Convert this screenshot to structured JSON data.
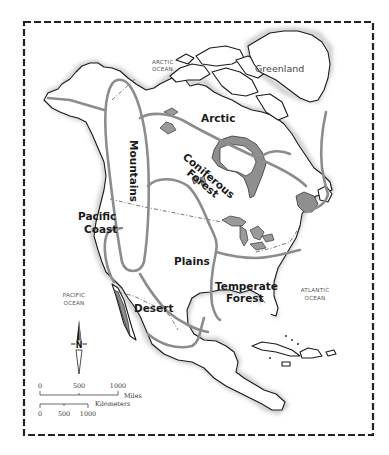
{
  "map": {
    "title": "North America Biomes",
    "regions": [
      {
        "id": "arctic",
        "label": "Arctic"
      },
      {
        "id": "mountains",
        "label": "Mountains"
      },
      {
        "id": "coniferous",
        "label_line1": "Coniferous",
        "label_line2": "Forest"
      },
      {
        "id": "pacific-coast",
        "label_line1": "Pacific",
        "label_line2": "Coast"
      },
      {
        "id": "plains",
        "label": "Plains"
      },
      {
        "id": "temperate",
        "label_line1": "Temperate",
        "label_line2": "Forest"
      },
      {
        "id": "desert",
        "label": "Desert"
      }
    ],
    "places": {
      "greenland": "Greenland"
    },
    "oceans": {
      "arctic_line1": "ARCTIC",
      "arctic_line2": "OCEAN",
      "pacific_line1": "PACIFIC",
      "pacific_line2": "OCEAN",
      "atlantic_line1": "ATLANTIC",
      "atlantic_line2": "OCEAN"
    },
    "compass": {
      "label": "N"
    },
    "scale": {
      "miles_ticks": [
        "0",
        "500",
        "1000"
      ],
      "miles_unit": "Miles",
      "km_ticks": [
        "0",
        "500",
        "1000"
      ],
      "km_unit": "Kilometers"
    },
    "colors": {
      "land": "#ffffff",
      "coast": "#1a1a1a",
      "region_line": "#8c8c8c",
      "water_fill": "#8f8f8f",
      "frame": "#222222"
    }
  }
}
